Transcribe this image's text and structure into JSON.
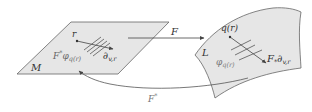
{
  "diagram": {
    "manifold_M": {
      "label": "M"
    },
    "manifold_L": {
      "label": "L"
    },
    "map_forward": {
      "label": "F"
    },
    "map_pullback": {
      "label": "F",
      "superscript": "*"
    },
    "point_M": {
      "label": "r"
    },
    "point_L": {
      "label": "q(r)"
    },
    "vector_M": {
      "label": "∂",
      "subscript": "v,r"
    },
    "vector_L": {
      "label": "F",
      "star": "*",
      "symbol": "∂",
      "subscript": "v,r"
    },
    "form_M": {
      "prefix": "F",
      "prefix_sup": "*",
      "symbol": "φ",
      "subscript": "q(r)"
    },
    "form_L": {
      "symbol": "φ",
      "subscript": "q(r)"
    },
    "colors": {
      "surface_fill": "#e6e6e6",
      "outline": "#555555",
      "text": "#333333",
      "text_faded": "#777777"
    }
  }
}
